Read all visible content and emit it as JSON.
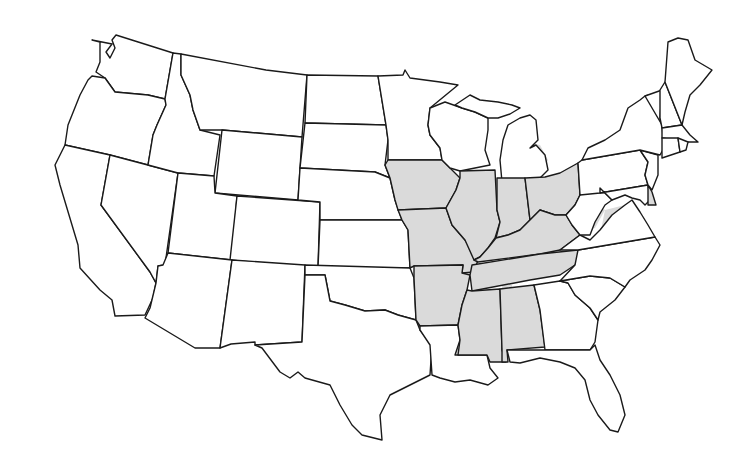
{
  "map": {
    "title": "United States map with shaded regions",
    "region": "Contiguous United States",
    "colors": {
      "background": "#ffffff",
      "state_fill": "#ffffff",
      "shaded_fill": "#dadada",
      "border": "#1a1a1a"
    },
    "fully_shaded_states": [
      "Iowa",
      "Missouri",
      "Illinois",
      "Indiana",
      "Ohio",
      "Kentucky",
      "Tennessee",
      "Arkansas",
      "Mississippi",
      "Alabama",
      "Delaware"
    ],
    "partially_shaded_states": [
      "Minnesota",
      "Wisconsin",
      "Michigan",
      "Nebraska",
      "Kansas",
      "Oklahoma",
      "Texas",
      "Louisiana",
      "Georgia",
      "Florida",
      "South Carolina",
      "North Carolina",
      "Virginia",
      "West Virginia",
      "Maryland",
      "Pennsylvania",
      "New York",
      "Vermont",
      "New Mexico"
    ],
    "unshaded_states": [
      "Washington",
      "Oregon",
      "California",
      "Nevada",
      "Idaho",
      "Montana",
      "Wyoming",
      "Utah",
      "Colorado",
      "Arizona",
      "North Dakota",
      "South Dakota",
      "Maine",
      "New Hampshire",
      "Massachusetts",
      "Rhode Island",
      "Connecticut",
      "New Jersey"
    ]
  }
}
